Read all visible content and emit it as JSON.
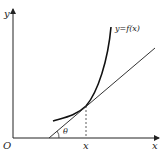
{
  "figure": {
    "origin_label": "O",
    "x_axis_label": "x",
    "y_axis_label": "y",
    "curve_label": "y=f(x)",
    "point_x_label": "x",
    "angle_label": "θ"
  }
}
